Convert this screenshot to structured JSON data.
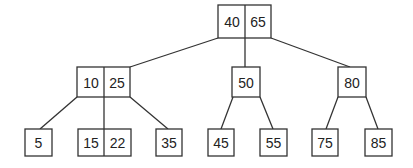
{
  "diagram": {
    "type": "b-tree",
    "nodes": {
      "root": {
        "keys": [
          "40",
          "65"
        ]
      },
      "left": {
        "keys": [
          "10",
          "25"
        ]
      },
      "middle": {
        "keys": [
          "50"
        ]
      },
      "right": {
        "keys": [
          "80"
        ]
      },
      "leaf_5": {
        "keys": [
          "5"
        ]
      },
      "leaf_15_22": {
        "keys": [
          "15",
          "22"
        ]
      },
      "leaf_35": {
        "keys": [
          "35"
        ]
      },
      "leaf_45": {
        "keys": [
          "45"
        ]
      },
      "leaf_55": {
        "keys": [
          "55"
        ]
      },
      "leaf_75": {
        "keys": [
          "75"
        ]
      },
      "leaf_85": {
        "keys": [
          "85"
        ]
      }
    },
    "edges": [
      [
        "root",
        "left"
      ],
      [
        "root",
        "middle"
      ],
      [
        "root",
        "right"
      ],
      [
        "left",
        "leaf_5"
      ],
      [
        "left",
        "leaf_15_22"
      ],
      [
        "left",
        "leaf_35"
      ],
      [
        "middle",
        "leaf_45"
      ],
      [
        "middle",
        "leaf_55"
      ],
      [
        "right",
        "leaf_75"
      ],
      [
        "right",
        "leaf_85"
      ]
    ],
    "colors": {
      "stroke": "#333333",
      "text": "#222222",
      "background": "#ffffff"
    }
  }
}
